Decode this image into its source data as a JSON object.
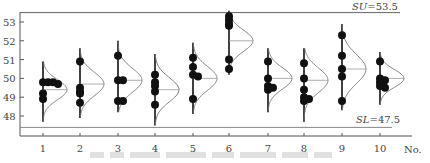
{
  "chart_data": {
    "type": "scatter",
    "subtype": "dot-plot-with-normal-curves",
    "title": "",
    "xlabel": "No.",
    "ylabel": "",
    "ylim": [
      47,
      53.6
    ],
    "yticks": [
      48,
      49,
      50,
      51,
      52,
      53
    ],
    "categories": [
      "1",
      "2",
      "3",
      "4",
      "5",
      "6",
      "7",
      "8",
      "9",
      "10"
    ],
    "limits": {
      "upper": {
        "label": "SU=53.5",
        "value": 53.5
      },
      "lower": {
        "label": "SL=47.5",
        "value": 47.5
      }
    },
    "groups": [
      {
        "no": "1",
        "points": [
          49.8,
          49.8,
          49.8,
          49.7,
          49.2,
          48.9
        ],
        "mean": 49.4,
        "min_whisker": 47.7,
        "max_whisker": 50.9
      },
      {
        "no": "2",
        "points": [
          50.9,
          49.5,
          49.3,
          49.2,
          48.7
        ],
        "mean": 49.7,
        "min_whisker": 47.9,
        "max_whisker": 51.6
      },
      {
        "no": "3",
        "points": [
          51.2,
          49.9,
          49.9,
          48.8,
          48.8
        ],
        "mean": 49.9,
        "min_whisker": 48.2,
        "max_whisker": 52.0
      },
      {
        "no": "4",
        "points": [
          50.2,
          49.8,
          49.6,
          49.3,
          48.6
        ],
        "mean": 49.4,
        "min_whisker": 47.5,
        "max_whisker": 51.3
      },
      {
        "no": "5",
        "points": [
          51.1,
          50.6,
          50.2,
          50.1,
          48.9
        ],
        "mean": 50.0,
        "min_whisker": 48.1,
        "max_whisker": 51.9
      },
      {
        "no": "6",
        "points": [
          53.3,
          53.1,
          52.9,
          52.8,
          51.0,
          50.5
        ],
        "mean": 52.0,
        "min_whisker": 50.2,
        "max_whisker": 53.6
      },
      {
        "no": "7",
        "points": [
          50.9,
          50.0,
          49.6,
          49.5,
          49.4
        ],
        "mean": 50.0,
        "min_whisker": 48.2,
        "max_whisker": 51.6
      },
      {
        "no": "8",
        "points": [
          50.8,
          50.0,
          49.4,
          49.0,
          48.9,
          48.8
        ],
        "mean": 49.9,
        "min_whisker": 47.7,
        "max_whisker": 51.6
      },
      {
        "no": "9",
        "points": [
          52.3,
          51.2,
          50.5,
          50.1,
          48.8
        ],
        "mean": 50.5,
        "min_whisker": 48.3,
        "max_whisker": 52.9
      },
      {
        "no": "10",
        "points": [
          50.9,
          50.0,
          49.9,
          49.8,
          49.6,
          49.5
        ],
        "mean": 50.0,
        "min_whisker": 48.6,
        "max_whisker": 51.4
      }
    ],
    "grid": false,
    "legend": null
  },
  "axis": {
    "x_label": "No.",
    "su_label": "SU",
    "su_value": "=53.5",
    "sl_label": "SL",
    "sl_value": "=47.5"
  },
  "caption": {
    "text": ""
  }
}
